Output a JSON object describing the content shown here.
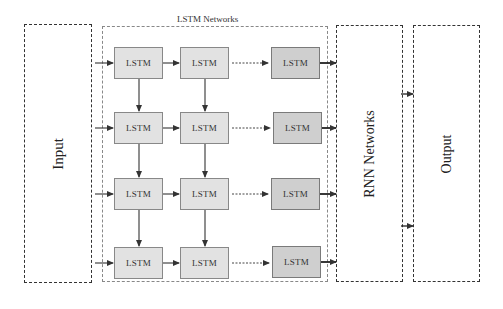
{
  "diagram": {
    "input_label": "Input",
    "lstm_group_title": "LSTM Networks",
    "rnn_label": "RNN Networks",
    "output_label": "Output",
    "cell_label": "LSTM",
    "rows": 4,
    "columns": 3,
    "cells": [
      [
        "LSTM",
        "LSTM",
        "LSTM"
      ],
      [
        "LSTM",
        "LSTM",
        "LSTM"
      ],
      [
        "LSTM",
        "LSTM",
        "LSTM"
      ],
      [
        "LSTM",
        "LSTM",
        "LSTM"
      ]
    ],
    "colors": {
      "cell_fill": "#e2e2e2",
      "last_cell_fill": "#cfcfcf",
      "border": "#333333",
      "arrow": "#333333"
    }
  }
}
